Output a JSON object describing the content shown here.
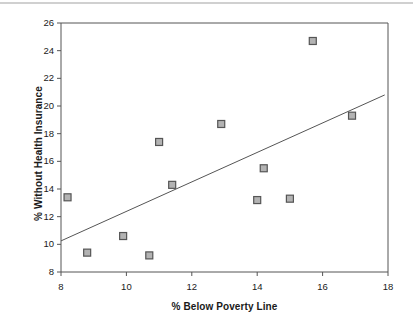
{
  "chart_data": {
    "type": "scatter",
    "title": "",
    "xlabel": "% Below Poverty Line",
    "ylabel": "% Without Health Insurance",
    "xlim": [
      8,
      18
    ],
    "ylim": [
      8,
      26
    ],
    "xticks": [
      8,
      10,
      12,
      14,
      16,
      18
    ],
    "yticks": [
      8,
      10,
      12,
      14,
      16,
      18,
      20,
      22,
      24,
      26
    ],
    "grid": false,
    "legend": "none",
    "marker": {
      "shape": "square",
      "fill": "#b3b3b3",
      "edge": "#555555",
      "size": 7
    },
    "points": [
      {
        "x": 8.2,
        "y": 13.4
      },
      {
        "x": 8.8,
        "y": 9.4
      },
      {
        "x": 9.9,
        "y": 10.6
      },
      {
        "x": 10.7,
        "y": 9.2
      },
      {
        "x": 11.0,
        "y": 17.4
      },
      {
        "x": 11.4,
        "y": 14.3
      },
      {
        "x": 12.9,
        "y": 18.7
      },
      {
        "x": 14.0,
        "y": 13.2
      },
      {
        "x": 14.2,
        "y": 15.5
      },
      {
        "x": 15.0,
        "y": 13.3
      },
      {
        "x": 15.7,
        "y": 24.7
      },
      {
        "x": 16.9,
        "y": 19.3
      }
    ],
    "trendline": {
      "type": "linear",
      "x_start": 8.0,
      "y_start": 10.25,
      "x_end": 17.9,
      "y_end": 20.8,
      "color": "#555555"
    },
    "axis_color": "#555555",
    "frame": {
      "left": 61,
      "right": 388,
      "top": 23,
      "bottom": 272
    }
  }
}
